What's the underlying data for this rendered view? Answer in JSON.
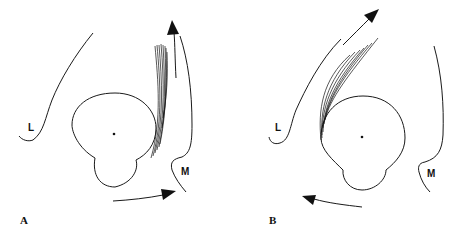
{
  "panels": [
    {
      "id": "A",
      "panel_label": "A",
      "lateral_label": "L",
      "medial_label": "M",
      "fiber_direction": "vertical along medial side",
      "upper_arrow": "upward",
      "lower_arrow": "rightward"
    },
    {
      "id": "B",
      "panel_label": "B",
      "lateral_label": "L",
      "medial_label": "M",
      "fiber_direction": "curving up and to the right along lateral side",
      "upper_arrow": "up-right",
      "lower_arrow": "leftward"
    }
  ],
  "colors": {
    "line": "#1a1a1a",
    "background": "#ffffff"
  }
}
